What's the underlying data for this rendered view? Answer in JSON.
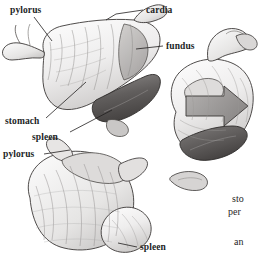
{
  "figure": {
    "background_color": "#ffffff",
    "ink_color": "#221f1f",
    "shading_light": "#e8e7e6",
    "shading_mid": "#b9b7b6",
    "shading_dark": "#6e6b6a",
    "shading_darkest": "#4a4746"
  },
  "labels": [
    {
      "id": "pylorus-top",
      "text": "pylorus"
    },
    {
      "id": "cardia",
      "text": "cardia"
    },
    {
      "id": "fundus",
      "text": "fundus"
    },
    {
      "id": "stomach",
      "text": "stomach"
    },
    {
      "id": "spleen-mid",
      "text": "spleen"
    },
    {
      "id": "pylorus-bot",
      "text": "pylorus"
    },
    {
      "id": "spleen-bot",
      "text": "spleen"
    }
  ],
  "clipped_text": [
    {
      "id": "sto",
      "text": "sto"
    },
    {
      "id": "per",
      "text": "per"
    },
    {
      "id": "an",
      "text": "an"
    }
  ]
}
